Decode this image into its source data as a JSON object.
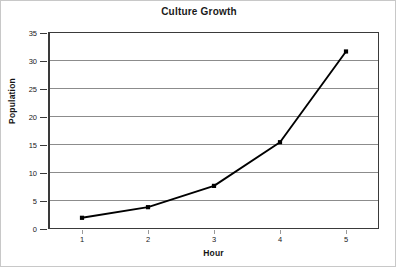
{
  "chart_data": {
    "type": "line",
    "title": "Culture Growth",
    "xlabel": "Hour",
    "ylabel": "Population",
    "x": [
      1,
      2,
      3,
      4,
      5
    ],
    "values": [
      2,
      3.9,
      7.7,
      15.5,
      31.7
    ],
    "series": [
      {
        "name": "Population",
        "x": [
          1,
          2,
          3,
          4,
          5
        ],
        "values": [
          2,
          3.9,
          7.7,
          15.5,
          31.7
        ]
      }
    ],
    "xlim": [
      0.5,
      5.5
    ],
    "ylim": [
      0,
      35
    ],
    "xticks": [
      1,
      2,
      3,
      4,
      5
    ],
    "yticks": [
      0,
      5,
      10,
      15,
      20,
      25,
      30,
      35
    ],
    "xtick_labels": [
      "1",
      "2",
      "3",
      "4",
      "5"
    ],
    "ytick_labels": [
      "0",
      "5",
      "10",
      "15",
      "20",
      "25",
      "30",
      "35"
    ],
    "grid": "horizontal",
    "legend": "none",
    "marker": "square",
    "colors": {
      "line": "#000000",
      "marker": "#000000",
      "gridline": "#8c8c8c",
      "axis": "#3a3a3a",
      "text": "#1a1a1a",
      "background": "#ffffff",
      "image_border": "#c8c8c8"
    }
  }
}
